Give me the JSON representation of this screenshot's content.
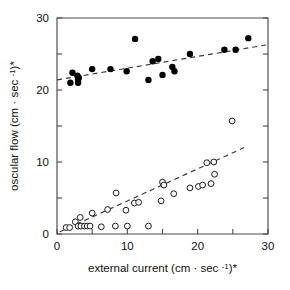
{
  "chart_data": {
    "type": "scatter",
    "title": "",
    "xlabel": "external current (cm · sec -1)*",
    "ylabel": "oscular flow (cm · sec -1)*",
    "xlabel_parts": {
      "prefix": "external current (cm · sec ",
      "exponent": "-1",
      "suffix": ")*"
    },
    "ylabel_parts": {
      "prefix": "oscular flow (cm · sec ",
      "exponent": "-1",
      "suffix": ")*"
    },
    "xlim": [
      0,
      30
    ],
    "ylim": [
      0,
      30
    ],
    "xticks": [
      0,
      5,
      10,
      15,
      20,
      25,
      30
    ],
    "yticks": [
      0,
      5,
      10,
      15,
      20,
      25,
      30
    ],
    "xtick_labels": [
      "0",
      "10",
      "20",
      "30"
    ],
    "xtick_label_values": [
      0,
      10,
      20,
      30
    ],
    "ytick_labels": [
      "0",
      "10",
      "20",
      "30"
    ],
    "ytick_label_values": [
      0,
      10,
      20,
      30
    ],
    "grid": false,
    "legend": "none",
    "frame": "box",
    "series": [
      {
        "name": "filled-circles",
        "marker": "filled-circle",
        "color": "#000000",
        "points": [
          [
            1.9,
            21.0
          ],
          [
            2.2,
            22.4
          ],
          [
            2.9,
            22.0
          ],
          [
            3.0,
            21.5
          ],
          [
            3.1,
            21.7
          ],
          [
            3.0,
            21.0
          ],
          [
            5.0,
            22.9
          ],
          [
            7.6,
            22.9
          ],
          [
            9.9,
            22.6
          ],
          [
            11.1,
            27.1
          ],
          [
            13.0,
            21.4
          ],
          [
            13.6,
            24.0
          ],
          [
            14.4,
            24.3
          ],
          [
            15.0,
            22.1
          ],
          [
            16.4,
            23.2
          ],
          [
            16.7,
            22.6
          ],
          [
            18.9,
            25.0
          ],
          [
            23.8,
            25.6
          ],
          [
            25.4,
            25.6
          ],
          [
            27.2,
            27.2
          ]
        ],
        "trendline": {
          "x": [
            0.0,
            30.0
          ],
          "y": [
            21.4,
            26.3
          ]
        }
      },
      {
        "name": "open-circles",
        "marker": "open-circle",
        "color": "#ffffff",
        "points": [
          [
            1.3,
            0.9
          ],
          [
            1.8,
            0.9
          ],
          [
            2.6,
            1.7
          ],
          [
            3.0,
            1.1
          ],
          [
            3.3,
            2.3
          ],
          [
            3.4,
            1.1
          ],
          [
            3.9,
            1.1
          ],
          [
            4.3,
            1.1
          ],
          [
            4.7,
            1.1
          ],
          [
            5.0,
            2.9
          ],
          [
            6.3,
            1.0
          ],
          [
            7.2,
            3.4
          ],
          [
            8.4,
            5.7
          ],
          [
            8.3,
            1.1
          ],
          [
            9.8,
            3.3
          ],
          [
            10.0,
            1.1
          ],
          [
            11.0,
            4.3
          ],
          [
            11.6,
            4.4
          ],
          [
            13.0,
            1.1
          ],
          [
            14.8,
            4.6
          ],
          [
            15.0,
            7.2
          ],
          [
            15.2,
            6.8
          ],
          [
            16.6,
            5.6
          ],
          [
            18.9,
            6.4
          ],
          [
            20.1,
            6.6
          ],
          [
            20.7,
            6.8
          ],
          [
            21.3,
            9.9
          ],
          [
            21.9,
            7.0
          ],
          [
            22.3,
            10.0
          ],
          [
            22.4,
            8.3
          ],
          [
            24.9,
            15.7
          ]
        ],
        "trendline": {
          "x": [
            0.4,
            26.6
          ],
          "y": [
            0.3,
            12.0
          ]
        }
      }
    ]
  }
}
